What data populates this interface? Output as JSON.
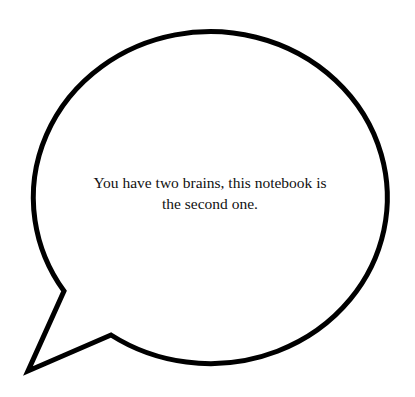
{
  "speech_bubble": {
    "text": "You have two brains, this notebook is the second one.",
    "stroke_color": "#000000",
    "fill_color": "#ffffff"
  }
}
